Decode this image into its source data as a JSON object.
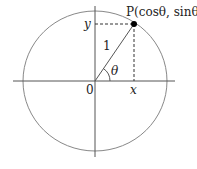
{
  "diagram": {
    "type": "unit-circle",
    "point_label": "P(cosθ, sinθ)",
    "y_label": "y",
    "x_label": "x",
    "origin_label": "0",
    "radius_label": "1",
    "angle_label": "θ",
    "colors": {
      "stroke": "#555555",
      "circle": "#888888",
      "point": "#000000",
      "text": "#222222"
    }
  }
}
